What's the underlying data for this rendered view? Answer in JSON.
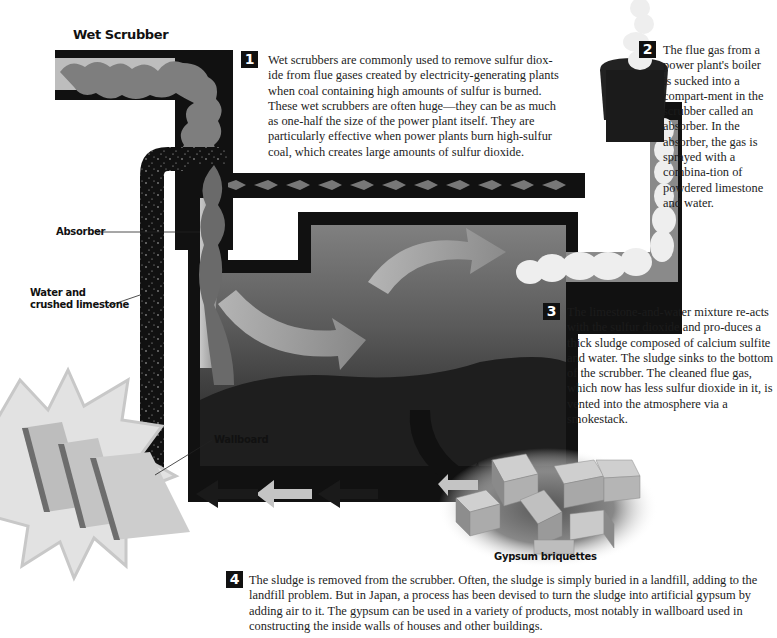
{
  "title": "Wet Scrubber",
  "steps": [
    {
      "number": "1",
      "text": "Wet scrubbers are commonly used to remove sulfur diox-ide from flue gases created by electricity-generating plants when coal containing high amounts of sulfur is burned. These wet scrubbers are often huge—they can be as much as one-half the size of the power plant itself. They are particularly effective when power plants burn high-sulfur coal, which creates large amounts of sulfur dioxide."
    },
    {
      "number": "2",
      "text": "The flue gas from a power plant's boiler is sucked into a compart-ment in the scrubber called an absorber. In the absorber, the gas is sprayed with a combina-tion of powdered limestone and water."
    },
    {
      "number": "3",
      "text": "The limestone-and-water mixture re-acts with the sulfur dioxide and pro-duces a thick sludge composed of calcium sulfite and water. The sludge sinks to the bottom of the scrubber. The cleaned flue gas, which now has less sulfur dioxide in it, is vented into the atmosphere via a smokestack."
    },
    {
      "number": "4",
      "text": "The sludge is removed from the scrubber. Often, the sludge is simply buried in a landfill, adding to the landfill problem. But in Japan, a process has been devised to turn the sludge into artificial gypsum by adding air to it. The gypsum can be used in a variety of products, most notably in wallboard used in constructing the inside walls of houses and other buildings."
    }
  ],
  "labels": {
    "absorber": "Absorber",
    "water_limestone_line1": "Water and",
    "water_limestone_line2": "crushed limestone",
    "wallboard": "Wallboard",
    "gypsum": "Gypsum briquettes"
  },
  "colors": {
    "pipe": "#111111",
    "tank_gas": "#6e6e6e",
    "flue_smoke": "#8a8a8a",
    "clean_gas": "#eeeeee",
    "arrow_light": "#c4c4c4",
    "arrow_dark": "#1a1a1a",
    "gypsum_face": "#bdbdbd"
  }
}
